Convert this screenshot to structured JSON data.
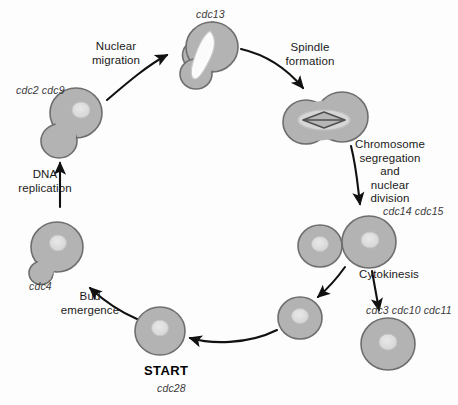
{
  "diagram": {
    "background_color": "#fdfdfd",
    "cell_fill": "#b3b3b3",
    "cell_stroke": "#6e6e6e",
    "nucleus_fill": "#dcdcdc",
    "nucleus_stroke": "#b8b8b8",
    "spindle_color": "#5a5a5a",
    "arrow_color": "#111111",
    "text_color": "#1a1a1a",
    "gene_color": "#3b3b3b"
  },
  "labels": {
    "nuclear_migration": "Nuclear\nmigration",
    "spindle_formation": "Spindle\nformation",
    "chromosome_segregation": "Chromosome\nsegregation\nand\nnuclear\ndivision",
    "cytokinesis": "Cytokinesis",
    "dna_replication": "DNA\nreplication",
    "bud_emergence": "Bud\nemergence",
    "start": "START"
  },
  "genes": {
    "cdc13": "cdc13",
    "cdc2_cdc9": "cdc2 cdc9",
    "cdc14_cdc15": "cdc14 cdc15",
    "cdc3_cdc10_cdc11": "cdc3 cdc10 cdc11",
    "cdc4": "cdc4",
    "cdc28": "cdc28"
  },
  "stages": [
    {
      "id": "start-cell",
      "name": "START unbudded cell",
      "gene": "cdc28",
      "label": "START",
      "shape": "single-round-cell",
      "cx": 160,
      "cy": 331,
      "rx": 25,
      "ry": 24,
      "nucleus": {
        "cx": 160,
        "cy": 328,
        "rx": 8,
        "ry": 7.5
      }
    },
    {
      "id": "bud-cell",
      "name": "Small budded cell",
      "gene": "cdc4",
      "shape": "budded-cell-small-bud",
      "cx": 57,
      "cy": 247,
      "rx": 26,
      "ry": 25,
      "bud": {
        "cx": 41,
        "cy": 274,
        "rx": 12,
        "ry": 11.5
      },
      "nucleus": {
        "cx": 58,
        "cy": 243,
        "rx": 8,
        "ry": 7.5
      }
    },
    {
      "id": "dna-replication-cell",
      "name": "Large budded cell after DNA replication",
      "gene": "cdc2 cdc9",
      "shape": "budded-cell-large-bud",
      "cx": 76,
      "cy": 113,
      "rx": 26,
      "ry": 25,
      "bud": {
        "cx": 59,
        "cy": 140,
        "rx": 18,
        "ry": 17
      },
      "nucleus": {
        "cx": 80,
        "cy": 110,
        "rx": 8.5,
        "ry": 8
      }
    },
    {
      "id": "nuclear-migration-cell",
      "name": "Cell with migrated elongated nucleus",
      "gene": "cdc13",
      "shape": "budded-cell-elongated-nucleus",
      "cx": 212,
      "cy": 47,
      "rx": 26,
      "ry": 25,
      "bud": {
        "cx": 196,
        "cy": 74,
        "rx": 16,
        "ry": 15
      },
      "nucleus": {
        "type": "elongated",
        "x1": 207,
        "y1": 36,
        "x2": 196,
        "y2": 77
      }
    },
    {
      "id": "spindle-cell",
      "name": "Dumbbell cell with mitotic spindle",
      "shape": "dumbbell-with-spindle",
      "left": {
        "cx": 307,
        "cy": 121,
        "rx": 23,
        "ry": 22
      },
      "right": {
        "cx": 342,
        "cy": 117,
        "rx": 26,
        "ry": 25
      },
      "nucleus": {
        "cx": 324,
        "cy": 120,
        "rx": 25,
        "ry": 10
      },
      "spindle": {
        "cx": 324,
        "cy": 120,
        "halfwidth": 20,
        "halfheight": 6
      }
    },
    {
      "id": "segregated-pair",
      "name": "Pair of cells after nuclear division",
      "gene": "cdc14 cdc15",
      "shape": "two-attached-cells",
      "small": {
        "cx": 320,
        "cy": 246,
        "rx": 22,
        "ry": 21,
        "nucleus": {
          "cx": 320,
          "cy": 244,
          "rx": 8,
          "ry": 7
        }
      },
      "large": {
        "cx": 369,
        "cy": 242,
        "rx": 27,
        "ry": 26,
        "nucleus": {
          "cx": 370,
          "cy": 240,
          "rx": 8.5,
          "ry": 8
        }
      }
    },
    {
      "id": "daughter-cell-small",
      "name": "Separated daughter cell",
      "shape": "single-round-cell",
      "cx": 300,
      "cy": 318,
      "rx": 22,
      "ry": 21,
      "nucleus": {
        "cx": 300,
        "cy": 316,
        "rx": 8,
        "ry": 7
      }
    },
    {
      "id": "daughter-cell-large",
      "name": "Separated mother cell",
      "gene": "cdc3 cdc10 cdc11",
      "shape": "single-round-cell",
      "cx": 388,
      "cy": 344,
      "rx": 26,
      "ry": 25,
      "nucleus": {
        "cx": 388,
        "cy": 342,
        "rx": 8.5,
        "ry": 8
      }
    }
  ],
  "arrows": [
    {
      "id": "arrow-nuclear-migration",
      "from": "dna-replication-cell",
      "to": "nuclear-migration-cell",
      "label": "Nuclear migration"
    },
    {
      "id": "arrow-spindle-formation",
      "from": "nuclear-migration-cell",
      "to": "spindle-cell",
      "label": "Spindle formation"
    },
    {
      "id": "arrow-chromosome-segregation",
      "from": "spindle-cell",
      "to": "segregated-pair",
      "label": "Chromosome segregation and nuclear division"
    },
    {
      "id": "arrow-cytokinesis-large",
      "from": "segregated-pair",
      "to": "daughter-cell-large",
      "label": "Cytokinesis"
    },
    {
      "id": "arrow-cytokinesis-small",
      "from": "segregated-pair",
      "to": "daughter-cell-small",
      "label": ""
    },
    {
      "id": "arrow-to-start",
      "from": "daughter-cell-small",
      "to": "start-cell",
      "label": ""
    },
    {
      "id": "arrow-bud-emergence",
      "from": "start-cell",
      "to": "bud-cell",
      "label": "Bud emergence"
    },
    {
      "id": "arrow-dna-replication",
      "from": "bud-cell",
      "to": "dna-replication-cell",
      "label": "DNA replication"
    }
  ]
}
